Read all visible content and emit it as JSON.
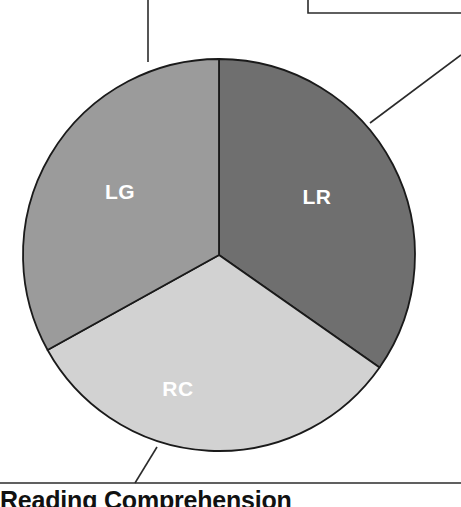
{
  "figure": {
    "background_color": "#ffffff",
    "caption": {
      "text": "Reading Comprehension",
      "note": "bold heading clipped by bottom edge of image"
    }
  },
  "chart_data": {
    "type": "pie",
    "title": "",
    "subtitle": "",
    "xlabel": "",
    "ylabel": "",
    "legend_position": "none",
    "labels_inside_slices": true,
    "center": {
      "x": 219,
      "y": 255
    },
    "radius": 196,
    "start_angle_deg": 0,
    "direction": "clockwise",
    "categories": [
      "LR",
      "RC",
      "LG"
    ],
    "values": [
      34.7,
      32.2,
      33.1
    ],
    "units": "percent",
    "slices": [
      {
        "label": "LR",
        "value": 34.7,
        "start_angle_deg": 0,
        "end_angle_deg": 125,
        "color": "#6f6f6f",
        "label_color": "#ffffff",
        "label_x": 317,
        "label_y": 198
      },
      {
        "label": "RC",
        "value": 32.2,
        "start_angle_deg": 125,
        "end_angle_deg": 241,
        "color": "#d2d2d2",
        "label_color": "#ffffff",
        "label_x": 178,
        "label_y": 390
      },
      {
        "label": "LG",
        "value": 33.1,
        "start_angle_deg": 241,
        "end_angle_deg": 360,
        "color": "#9b9b9b",
        "label_color": "#ffffff",
        "label_x": 120,
        "label_y": 193
      }
    ],
    "slice_outline_color": "#1a1a1a"
  },
  "annotations": {
    "line_color": "#2b2b2b",
    "leaders": [
      {
        "name": "leader-top-lg",
        "points": "148,0 148,62",
        "anchors": "LG"
      },
      {
        "name": "leader-right-lr",
        "points": "370,123 461,55",
        "anchors": "LR"
      },
      {
        "name": "leader-bottom-rc",
        "points": "157,447 135,483",
        "anchors": "RC"
      }
    ],
    "callout_box": {
      "name": "callout-box-top-right",
      "left_edge_x": 308,
      "top_y": 0,
      "bottom_y": 13,
      "right_x": 461
    },
    "caption_rule": {
      "name": "caption-rule",
      "y": 483,
      "x_start": 0,
      "x_end": 461
    }
  }
}
